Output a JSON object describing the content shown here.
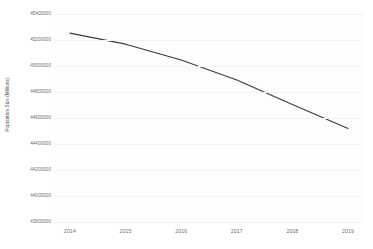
{
  "chart_data": {
    "type": "line",
    "title": "",
    "xlabel": "",
    "ylabel": "Population Size (Millions)",
    "categories": [
      "2014",
      "2015",
      "2016",
      "2017",
      "2018",
      "2019"
    ],
    "x": [
      2014,
      2015,
      2016,
      2017,
      2018,
      2019
    ],
    "series": [
      {
        "name": "Population Size",
        "values": [
          45253000,
          45168000,
          45046000,
          44893000,
          44704000,
          44520000
        ]
      }
    ],
    "ylim": [
      43800000,
      45400000
    ],
    "ytick_labels": [
      "45400000",
      "45200000",
      "45000000",
      "44800000",
      "44600000",
      "44400000",
      "44200000",
      "44000000",
      "43800000"
    ],
    "ytick_values": [
      45400000,
      45200000,
      45000000,
      44800000,
      44600000,
      44400000,
      44200000,
      44000000,
      43800000
    ],
    "xtick_labels": [
      "2014",
      "2015",
      "2016",
      "2017",
      "2018",
      "2019"
    ],
    "grid": true,
    "legend": false,
    "line_color": "#3a3a3a",
    "grid_color": "#f3f3f3",
    "background_color": "#fdfdfd"
  }
}
